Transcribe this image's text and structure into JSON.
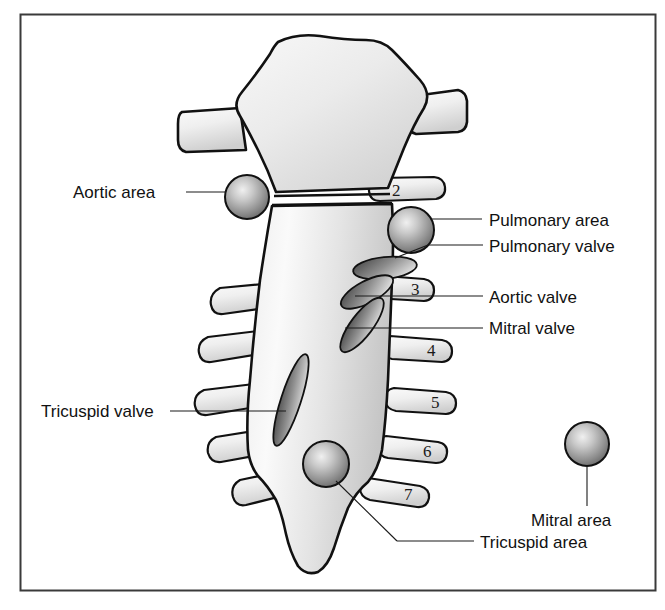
{
  "figure": {
    "title": "Surface anatomy of cardiac auscultation areas on the sternum and ribs",
    "background_color": "#ffffff",
    "frame_color": "#3a3a3a"
  },
  "labels": {
    "aortic_area": "Aortic area",
    "pulmonary_area": "Pulmonary area",
    "pulmonary_valve": "Pulmonary valve",
    "aortic_valve": "Aortic valve",
    "mitral_valve": "Mitral valve",
    "tricuspid_valve": "Tricuspid valve",
    "mitral_area": "Mitral area",
    "tricuspid_area": "Tricuspid area"
  },
  "rib_numbers": {
    "rib2": "2",
    "rib3": "3",
    "rib4": "4",
    "rib5": "5",
    "rib6": "6",
    "rib7": "7"
  },
  "colors": {
    "bone_outline": "#111111",
    "bone_fill_light": "#f4f4f4",
    "bone_fill_shadow": "#c9c9c9",
    "valve_dark": "#4a4a4a",
    "valve_light": "#d8d8d8",
    "sphere_dark": "#5d5d5d",
    "sphere_light": "#e6e6e6",
    "leader_line": "#1a1a1a",
    "text": "#111111"
  },
  "icons": {
    "auscultation_marker": "sphere-marker-icon",
    "valve_marker": "ellipse-valve-icon",
    "rib_marker": "rib-bar-icon"
  }
}
